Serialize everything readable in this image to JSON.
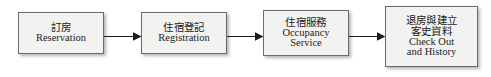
{
  "diagram": {
    "type": "linear-process-flow",
    "orientation": "left-to-right",
    "title": "",
    "colors": {
      "box_fill": "#f2f2f0",
      "box_border": "#6b6b6b",
      "arrow": "#1b1b1b",
      "text": "#1b1b1b",
      "background": "#ffffff"
    },
    "nodes": [
      {
        "id": "reservation",
        "lines": [
          "訂房",
          "Reservation"
        ],
        "cjk": "訂房",
        "roman": "Reservation",
        "step": 1
      },
      {
        "id": "registration",
        "lines": [
          "住宿登記",
          "Registration"
        ],
        "cjk": "住宿登記",
        "roman": "Registration",
        "step": 2
      },
      {
        "id": "occupancy",
        "lines": [
          "住宿服務",
          "Occupancy",
          "Service"
        ],
        "cjk": "住宿服務",
        "roman_line1": "Occupancy",
        "roman_line2": "Service",
        "step": 3
      },
      {
        "id": "checkout",
        "lines": [
          "退房與建立",
          "客史資料",
          "Check Out",
          "and History"
        ],
        "cjk_line1": "退房與建立",
        "cjk_line2": "客史資料",
        "roman_line1": "Check Out",
        "roman_line2": "and History",
        "step": 4
      }
    ],
    "connectors": [
      {
        "id": "arrow-1",
        "from": "reservation",
        "to": "registration",
        "style": "solid-line-filled-arrowhead"
      },
      {
        "id": "arrow-2",
        "from": "registration",
        "to": "occupancy",
        "style": "solid-line-filled-arrowhead"
      },
      {
        "id": "arrow-3",
        "from": "occupancy",
        "to": "checkout",
        "style": "solid-line-filled-arrowhead"
      }
    ]
  }
}
